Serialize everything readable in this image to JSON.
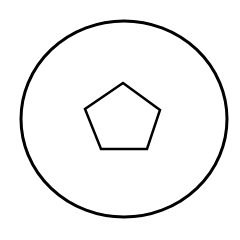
{
  "canvas": {
    "width": 240,
    "height": 240,
    "background": "#ffffff"
  },
  "shapes": {
    "outer_ellipse": {
      "cx": 124,
      "cy": 119,
      "rx": 103,
      "ry": 98,
      "stroke": "#000000",
      "stroke_width": 3,
      "fill": "none"
    },
    "inner_pentagon": {
      "points": "123,83 160,110 147,149 101,149 85,109",
      "stroke": "#000000",
      "stroke_width": 2.5,
      "fill": "none"
    }
  }
}
